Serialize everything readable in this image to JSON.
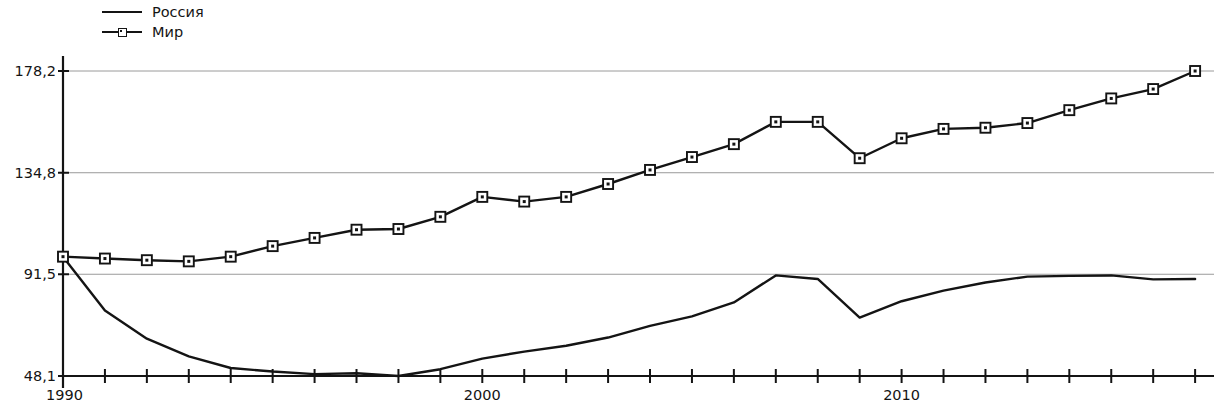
{
  "legend": {
    "position": "top-left",
    "items": [
      {
        "label": "Россия",
        "marker": "none",
        "line": "solid"
      },
      {
        "label": "Мир",
        "marker": "square",
        "line": "solid"
      }
    ]
  },
  "axes": {
    "y_tick_labels": [
      "178,2",
      "134,8",
      "91,5",
      "48,1"
    ],
    "y_tick_values": [
      178.2,
      134.8,
      91.5,
      48.1
    ],
    "x_tick_labels": [
      "1990",
      "2000",
      "2010"
    ],
    "x_tick_values": [
      1990,
      2000,
      2010
    ]
  },
  "style": {
    "line_color": "#141414",
    "grid_color": "#9a9a9a",
    "axis_color": "#141414",
    "marker_fill": "#ffffff",
    "background": "#ffffff"
  },
  "chart_data": {
    "type": "line",
    "title": "",
    "subtitle": "",
    "xlabel": "",
    "ylabel": "",
    "grid": "horizontal",
    "legend_position": "top-left",
    "xlim": [
      1990,
      2017
    ],
    "ylim": [
      48.1,
      178.2
    ],
    "yticks": [
      48.1,
      91.5,
      134.8,
      178.2
    ],
    "xticks": [
      1990,
      2000,
      2010
    ],
    "x": [
      1990,
      1991,
      1992,
      1993,
      1994,
      1995,
      1996,
      1997,
      1998,
      1999,
      2000,
      2001,
      2002,
      2003,
      2004,
      2005,
      2006,
      2007,
      2008,
      2009,
      2010,
      2011,
      2012,
      2013,
      2014,
      2015,
      2016,
      2017
    ],
    "series": [
      {
        "name": "Россия",
        "marker": "none",
        "values": [
          99.0,
          76.0,
          64.0,
          56.5,
          51.5,
          50.0,
          48.9,
          49.3,
          48.1,
          51.0,
          55.5,
          58.5,
          61.0,
          64.5,
          69.5,
          73.5,
          79.5,
          91.0,
          89.5,
          73.0,
          80.0,
          84.5,
          88.0,
          90.5,
          90.8,
          91.0,
          89.3,
          89.5
        ]
      },
      {
        "name": "Мир",
        "marker": "square",
        "values": [
          99.0,
          98.2,
          97.5,
          97.0,
          99.0,
          103.5,
          107.0,
          110.5,
          110.8,
          116.0,
          124.5,
          122.5,
          124.5,
          130.0,
          136.0,
          141.5,
          147.0,
          156.5,
          156.5,
          141.0,
          149.5,
          153.5,
          154.0,
          156.0,
          161.5,
          166.5,
          170.5,
          178.2
        ]
      }
    ]
  }
}
